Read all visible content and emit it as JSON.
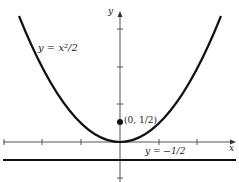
{
  "diagram": {
    "curve_label": "y = x²/2",
    "curve_label_var": "y",
    "curve_label_eq": " = ",
    "curve_label_rhs": "x²/2",
    "focus_label": "(0, 1/2)",
    "directrix_label": "y = −1/2",
    "x_axis_label": "x",
    "y_axis_label": "y",
    "colors": {
      "curve": "#111111",
      "axis": "#555555",
      "directrix": "#111111",
      "point": "#111111"
    }
  }
}
